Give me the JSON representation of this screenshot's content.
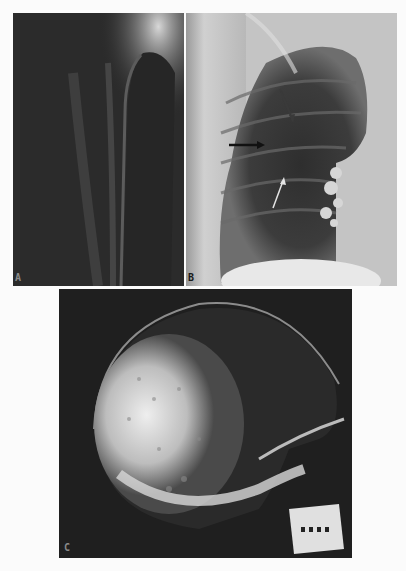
{
  "figure": {
    "panels": [
      {
        "id": "A",
        "label": "A",
        "description": "Radiograph of long bone (humerus), dark background"
      },
      {
        "id": "B",
        "label": "B",
        "description": "Chest radiograph with three arrows indicating lung findings"
      },
      {
        "id": "C",
        "label": "C",
        "description": "Lateral skull radiograph showing mottled bright area"
      }
    ],
    "arrows_panel_b": [
      {
        "color": "#3a3a3a",
        "from": [
          94,
          76
        ],
        "to": [
          107,
          108
        ]
      },
      {
        "color": "#111111",
        "from": [
          43,
          132
        ],
        "to": [
          77,
          132
        ]
      },
      {
        "color": "#e0e0e0",
        "from": [
          87,
          195
        ],
        "to": [
          98,
          165
        ]
      }
    ]
  }
}
